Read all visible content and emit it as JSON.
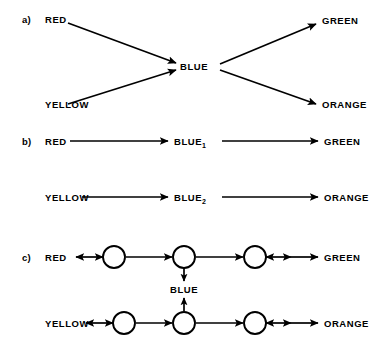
{
  "page": {
    "running_head": "",
    "width": 383,
    "height": 347,
    "ink_color": "#000000",
    "background_color": "#ffffff"
  },
  "panels": [
    {
      "tag": "a)",
      "type": "converge-diverge",
      "nodes": {
        "inputs": [
          "RED",
          "YELLOW"
        ],
        "hub": "BLUE",
        "outputs": [
          "GREEN",
          "ORANGE"
        ]
      },
      "edges": [
        {
          "from": "RED",
          "to": "BLUE",
          "arrow": "single"
        },
        {
          "from": "YELLOW",
          "to": "BLUE",
          "arrow": "single"
        },
        {
          "from": "BLUE",
          "to": "GREEN",
          "arrow": "single"
        },
        {
          "from": "BLUE",
          "to": "ORANGE",
          "arrow": "single"
        }
      ]
    },
    {
      "tag": "b)",
      "type": "parallel-chains",
      "rows": [
        {
          "nodes": [
            "RED",
            "BLUE",
            "GREEN"
          ],
          "hub_label": "BLUE",
          "hub_subscript": "1"
        },
        {
          "nodes": [
            "YELLOW",
            "BLUE",
            "ORANGE"
          ],
          "hub_label": "BLUE",
          "hub_subscript": "2"
        }
      ],
      "edges": [
        {
          "from": "RED",
          "to": "BLUE1",
          "arrow": "single"
        },
        {
          "from": "BLUE1",
          "to": "GREEN",
          "arrow": "single"
        },
        {
          "from": "YELLOW",
          "to": "BLUE2",
          "arrow": "single"
        },
        {
          "from": "BLUE2",
          "to": "ORANGE",
          "arrow": "single"
        }
      ]
    },
    {
      "tag": "c)",
      "type": "coupled-networks",
      "rows": [
        {
          "left_label": "RED",
          "right_label": "GREEN",
          "units": 3
        },
        {
          "left_label": "YELLOW",
          "right_label": "ORANGE",
          "units": 3
        }
      ],
      "coupling_label": "BLUE",
      "edges": [
        {
          "from": "RED",
          "to": "unit-1",
          "arrow": "double"
        },
        {
          "from": "unit-1",
          "to": "unit-2",
          "arrow": "single"
        },
        {
          "from": "unit-2",
          "to": "unit-3",
          "arrow": "single"
        },
        {
          "from": "unit-3",
          "to": "GREEN",
          "arrow": "double"
        },
        {
          "from": "YELLOW",
          "to": "unit-4",
          "arrow": "double"
        },
        {
          "from": "unit-4",
          "to": "unit-5",
          "arrow": "single"
        },
        {
          "from": "unit-5",
          "to": "unit-6",
          "arrow": "single"
        },
        {
          "from": "unit-6",
          "to": "ORANGE",
          "arrow": "double"
        },
        {
          "from": "unit-2",
          "to": "unit-5",
          "arrow": "double",
          "orientation": "vertical",
          "label": "BLUE"
        }
      ]
    }
  ],
  "labels": {
    "a_tag": "a)",
    "a_red": "RED",
    "a_yellow": "YELLOW",
    "a_blue": "BLUE",
    "a_green": "GREEN",
    "a_orange": "ORANGE",
    "b_tag": "b)",
    "b_red": "RED",
    "b_blue1_base": "BLUE",
    "b_blue1_sub": "1",
    "b_green": "GREEN",
    "b_yellow": "YELLOW",
    "b_blue2_base": "BLUE",
    "b_blue2_sub": "2",
    "b_orange": "ORANGE",
    "c_tag": "c)",
    "c_red": "RED",
    "c_green": "GREEN",
    "c_blue": "BLUE",
    "c_yellow": "YELLOW",
    "c_orange": "ORANGE"
  }
}
